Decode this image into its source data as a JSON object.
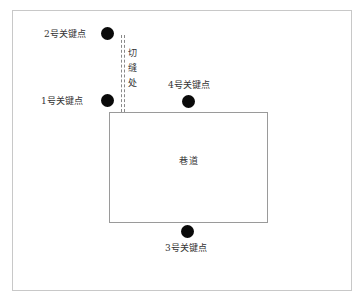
{
  "diagram": {
    "roadway": {
      "label": "巷道"
    },
    "key_points": [
      {
        "id": 1,
        "label": "1号关键点"
      },
      {
        "id": 2,
        "label": "2号关键点"
      },
      {
        "id": 3,
        "label": "3号关键点"
      },
      {
        "id": 4,
        "label": "4号关键点"
      }
    ],
    "cut_slot": {
      "chars": [
        "切",
        "缝",
        "处"
      ]
    },
    "colors": {
      "dot": "#0a0a0a",
      "frame": "#c8c8c8",
      "roadway_border": "#9a9a9a",
      "dashed_line": "#8a8a8a",
      "text": "#333333"
    }
  }
}
